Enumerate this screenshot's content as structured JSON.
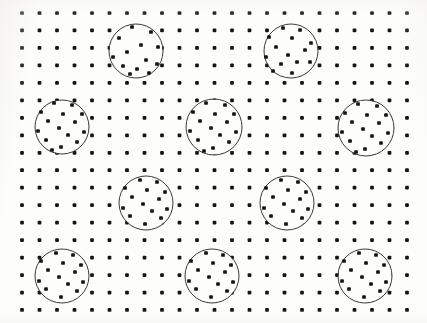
{
  "figure": {
    "width": 427,
    "height": 323,
    "background_color": "#fdfdfc",
    "dot_color": "#141414",
    "circle_stroke_color": "#3a3a3a",
    "circle_stroke_width": 1
  },
  "chart_data": {
    "type": "scatter",
    "subtitle": "",
    "xlabel": "",
    "ylabel": "",
    "xlim": [
      0,
      427
    ],
    "ylim": [
      0,
      323
    ],
    "grid": false,
    "legend": "none",
    "annotations": [],
    "background_grid": {
      "name": "regular-dot-lattice",
      "columns": 23,
      "rows": 18,
      "x_start": 22,
      "y_start": 13,
      "x_spacing": 17.5,
      "y_spacing": 17.47,
      "dot_radius": 2.1,
      "dot_shape": "square-dot",
      "total_dots": 414
    },
    "circles": [
      {
        "id": 1,
        "cx": 136,
        "cy": 51,
        "r": 27,
        "inner_dot_count": 13,
        "inner_dots": [
          [
            132,
            27
          ],
          [
            151,
            32
          ],
          [
            119,
            38
          ],
          [
            141,
            45
          ],
          [
            158,
            47
          ],
          [
            127,
            52
          ],
          [
            113,
            57
          ],
          [
            146,
            60
          ],
          [
            157,
            64
          ],
          [
            123,
            66
          ],
          [
            137,
            69
          ],
          [
            130,
            74
          ],
          [
            149,
            73
          ]
        ]
      },
      {
        "id": 2,
        "cx": 291,
        "cy": 51,
        "r": 27,
        "inner_dot_count": 14,
        "inner_dots": [
          [
            283,
            28
          ],
          [
            300,
            30
          ],
          [
            269,
            37
          ],
          [
            292,
            38
          ],
          [
            311,
            43
          ],
          [
            276,
            47
          ],
          [
            305,
            50
          ],
          [
            288,
            55
          ],
          [
            266,
            57
          ],
          [
            297,
            62
          ],
          [
            281,
            64
          ],
          [
            310,
            62
          ],
          [
            273,
            71
          ],
          [
            292,
            73
          ]
        ]
      },
      {
        "id": 3,
        "cx": 62,
        "cy": 127,
        "r": 27,
        "inner_dot_count": 15,
        "inner_dots": [
          [
            54,
            103
          ],
          [
            72,
            105
          ],
          [
            41,
            112
          ],
          [
            63,
            114
          ],
          [
            82,
            114
          ],
          [
            48,
            121
          ],
          [
            75,
            122
          ],
          [
            59,
            128
          ],
          [
            38,
            131
          ],
          [
            68,
            135
          ],
          [
            84,
            132
          ],
          [
            46,
            140
          ],
          [
            77,
            142
          ],
          [
            61,
            147
          ],
          [
            52,
            150
          ]
        ]
      },
      {
        "id": 4,
        "cx": 214,
        "cy": 127,
        "r": 28,
        "inner_dot_count": 15,
        "inner_dots": [
          [
            206,
            103
          ],
          [
            225,
            105
          ],
          [
            193,
            112
          ],
          [
            215,
            114
          ],
          [
            234,
            114
          ],
          [
            200,
            121
          ],
          [
            227,
            122
          ],
          [
            211,
            128
          ],
          [
            190,
            131
          ],
          [
            220,
            135
          ],
          [
            236,
            132
          ],
          [
            198,
            140
          ],
          [
            229,
            142
          ],
          [
            213,
            148
          ],
          [
            204,
            151
          ]
        ]
      },
      {
        "id": 5,
        "cx": 366,
        "cy": 128,
        "r": 28,
        "inner_dot_count": 15,
        "inner_dots": [
          [
            358,
            104
          ],
          [
            377,
            106
          ],
          [
            345,
            113
          ],
          [
            367,
            115
          ],
          [
            386,
            115
          ],
          [
            352,
            122
          ],
          [
            379,
            123
          ],
          [
            363,
            129
          ],
          [
            342,
            132
          ],
          [
            372,
            136
          ],
          [
            388,
            133
          ],
          [
            350,
            141
          ],
          [
            381,
            143
          ],
          [
            365,
            149
          ],
          [
            356,
            152
          ]
        ]
      },
      {
        "id": 6,
        "cx": 146,
        "cy": 203,
        "r": 27,
        "inner_dot_count": 14,
        "inner_dots": [
          [
            140,
            180
          ],
          [
            157,
            182
          ],
          [
            125,
            188
          ],
          [
            147,
            190
          ],
          [
            165,
            192
          ],
          [
            132,
            197
          ],
          [
            159,
            199
          ],
          [
            143,
            204
          ],
          [
            123,
            208
          ],
          [
            152,
            211
          ],
          [
            167,
            209
          ],
          [
            130,
            216
          ],
          [
            161,
            218
          ],
          [
            145,
            224
          ]
        ]
      },
      {
        "id": 7,
        "cx": 287,
        "cy": 203,
        "r": 27,
        "inner_dot_count": 14,
        "inner_dots": [
          [
            281,
            180
          ],
          [
            298,
            182
          ],
          [
            266,
            188
          ],
          [
            288,
            190
          ],
          [
            306,
            192
          ],
          [
            273,
            197
          ],
          [
            300,
            199
          ],
          [
            284,
            204
          ],
          [
            264,
            208
          ],
          [
            293,
            211
          ],
          [
            308,
            209
          ],
          [
            271,
            216
          ],
          [
            302,
            218
          ],
          [
            286,
            224
          ]
        ]
      },
      {
        "id": 8,
        "cx": 62,
        "cy": 276,
        "r": 27,
        "inner_dot_count": 14,
        "inner_dots": [
          [
            56,
            253
          ],
          [
            73,
            255
          ],
          [
            41,
            261
          ],
          [
            63,
            263
          ],
          [
            81,
            265
          ],
          [
            48,
            270
          ],
          [
            75,
            272
          ],
          [
            59,
            277
          ],
          [
            39,
            281
          ],
          [
            68,
            284
          ],
          [
            83,
            282
          ],
          [
            46,
            289
          ],
          [
            77,
            291
          ],
          [
            61,
            297
          ]
        ]
      },
      {
        "id": 9,
        "cx": 212,
        "cy": 276,
        "r": 27,
        "inner_dot_count": 14,
        "inner_dots": [
          [
            206,
            253
          ],
          [
            223,
            255
          ],
          [
            191,
            261
          ],
          [
            213,
            263
          ],
          [
            231,
            265
          ],
          [
            198,
            270
          ],
          [
            225,
            272
          ],
          [
            209,
            277
          ],
          [
            189,
            281
          ],
          [
            218,
            284
          ],
          [
            233,
            282
          ],
          [
            196,
            289
          ],
          [
            227,
            291
          ],
          [
            211,
            297
          ]
        ]
      },
      {
        "id": 10,
        "cx": 365,
        "cy": 276,
        "r": 27,
        "inner_dot_count": 14,
        "inner_dots": [
          [
            359,
            253
          ],
          [
            376,
            255
          ],
          [
            344,
            261
          ],
          [
            366,
            263
          ],
          [
            384,
            265
          ],
          [
            351,
            270
          ],
          [
            378,
            272
          ],
          [
            362,
            277
          ],
          [
            342,
            281
          ],
          [
            371,
            284
          ],
          [
            386,
            282
          ],
          [
            349,
            289
          ],
          [
            380,
            291
          ],
          [
            364,
            297
          ]
        ]
      }
    ]
  }
}
